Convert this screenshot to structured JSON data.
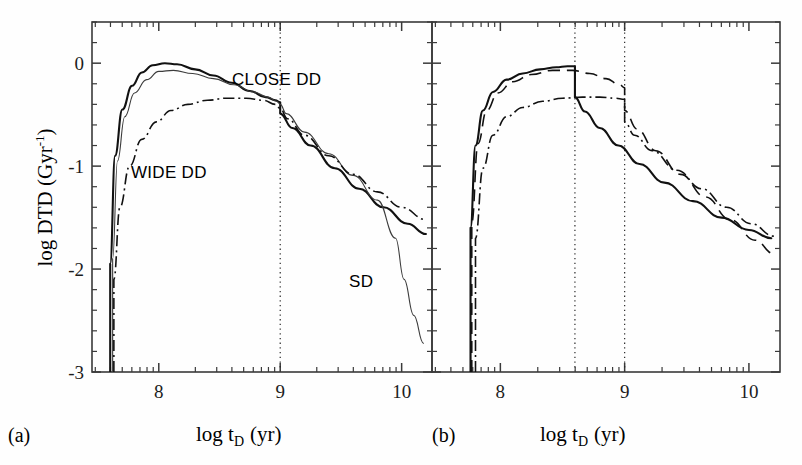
{
  "figure": {
    "panels": [
      {
        "id": "a",
        "tag": "(a)",
        "xlabel_main": "log t",
        "xlabel_sub": "D",
        "xlabel_unit": "(yr)",
        "ylabel_main": "log DTD  (Gyr",
        "ylabel_sup": "-1",
        "ylabel_close": ")",
        "xticks": [
          "8",
          "9",
          "10"
        ],
        "yticks": [
          "0",
          "-1",
          "-2",
          "-3"
        ],
        "annotations": [
          {
            "name": "close-dd-label",
            "text": "CLOSE DD",
            "x": 235,
            "y": 83
          },
          {
            "name": "wide-dd-label",
            "text": "WIDE DD",
            "x": 133,
            "y": 175
          },
          {
            "name": "sd-label",
            "text": "SD",
            "x": 350,
            "y": 284
          }
        ],
        "vlines": [
          9.0
        ]
      },
      {
        "id": "b",
        "tag": "(b)",
        "xlabel_main": "log t",
        "xlabel_sub": "D",
        "xlabel_unit": "(yr)",
        "xticks": [
          "8",
          "9",
          "10"
        ],
        "annotations": [],
        "vlines": [
          8.6,
          9.0
        ]
      }
    ]
  },
  "chart_data": {
    "type": "line",
    "title": "",
    "xlabel": "log t_D (yr)",
    "ylabel": "log DTD (Gyr^-1)",
    "xlim": [
      7.45,
      10.25
    ],
    "ylim": [
      -3.0,
      0.4
    ],
    "grid": false,
    "legend": "inline-annotations",
    "xticks_major": [
      8,
      9,
      10
    ],
    "yticks_major": [
      0,
      -1,
      -2,
      -3
    ],
    "panels": [
      {
        "id": "a",
        "label": "(a)",
        "vertical_dotted_lines": [
          9.0
        ],
        "series": [
          {
            "name": "CLOSE DD",
            "style": "solid-thick",
            "x": [
              7.6,
              7.6,
              7.64,
              7.7,
              7.78,
              7.86,
              7.95,
              8.05,
              8.15,
              8.3,
              8.45,
              8.6,
              8.75,
              8.88,
              8.96,
              9.0,
              9.0,
              9.1,
              9.25,
              9.45,
              9.65,
              9.85,
              10.05,
              10.2
            ],
            "y": [
              -3.0,
              -1.95,
              -0.9,
              -0.45,
              -0.22,
              -0.09,
              -0.02,
              0.0,
              -0.01,
              -0.06,
              -0.12,
              -0.19,
              -0.27,
              -0.33,
              -0.36,
              -0.38,
              -0.49,
              -0.63,
              -0.8,
              -1.02,
              -1.22,
              -1.4,
              -1.56,
              -1.66
            ]
          },
          {
            "name": "SD",
            "style": "solid-thin",
            "x": [
              7.62,
              7.62,
              7.66,
              7.72,
              7.8,
              7.9,
              8.0,
              8.12,
              8.28,
              8.45,
              8.62,
              8.78,
              8.9,
              8.97,
              9.0,
              9.05,
              9.2,
              9.4,
              9.6,
              9.8,
              9.95,
              10.02,
              10.1,
              10.18
            ],
            "y": [
              -3.0,
              -1.9,
              -0.95,
              -0.52,
              -0.29,
              -0.16,
              -0.08,
              -0.07,
              -0.1,
              -0.15,
              -0.21,
              -0.28,
              -0.33,
              -0.37,
              -0.4,
              -0.49,
              -0.67,
              -0.88,
              -1.09,
              -1.33,
              -1.7,
              -2.1,
              -2.45,
              -2.72
            ]
          },
          {
            "name": "WIDE DD",
            "style": "dash-dot",
            "x": [
              7.63,
              7.63,
              7.68,
              7.76,
              7.86,
              7.98,
              8.1,
              8.24,
              8.4,
              8.56,
              8.72,
              8.86,
              8.96,
              9.0,
              9.06,
              9.2,
              9.4,
              9.6,
              9.8,
              10.0,
              10.2
            ],
            "y": [
              -3.0,
              -2.1,
              -1.4,
              -1.0,
              -0.74,
              -0.57,
              -0.46,
              -0.4,
              -0.36,
              -0.34,
              -0.34,
              -0.36,
              -0.4,
              -0.44,
              -0.54,
              -0.7,
              -0.9,
              -1.08,
              -1.25,
              -1.4,
              -1.52
            ]
          }
        ]
      },
      {
        "id": "b",
        "label": "(b)",
        "vertical_dotted_lines": [
          8.6,
          9.0
        ],
        "series": [
          {
            "name": "solid",
            "style": "solid-thick",
            "x": [
              7.76,
              7.76,
              7.8,
              7.86,
              7.94,
              8.05,
              8.18,
              8.32,
              8.45,
              8.54,
              8.6,
              8.6,
              8.68,
              8.8,
              8.95,
              9.12,
              9.32,
              9.55,
              9.78,
              10.0,
              10.18
            ],
            "y": [
              -3.0,
              -1.6,
              -0.8,
              -0.46,
              -0.28,
              -0.16,
              -0.1,
              -0.06,
              -0.04,
              -0.03,
              -0.03,
              -0.33,
              -0.47,
              -0.63,
              -0.8,
              -0.98,
              -1.16,
              -1.34,
              -1.5,
              -1.62,
              -1.7
            ]
          },
          {
            "name": "dashed",
            "style": "dashed",
            "x": [
              7.77,
              7.77,
              7.82,
              7.89,
              7.98,
              8.1,
              8.25,
              8.42,
              8.58,
              8.72,
              8.85,
              8.96,
              9.0,
              9.0,
              9.1,
              9.25,
              9.45,
              9.65,
              9.85,
              10.05,
              10.2
            ],
            "y": [
              -3.0,
              -1.55,
              -0.78,
              -0.46,
              -0.29,
              -0.18,
              -0.11,
              -0.07,
              -0.07,
              -0.1,
              -0.15,
              -0.21,
              -0.24,
              -0.46,
              -0.64,
              -0.85,
              -1.08,
              -1.3,
              -1.52,
              -1.72,
              -1.85
            ]
          },
          {
            "name": "dash-dot",
            "style": "dash-dot",
            "x": [
              7.8,
              7.8,
              7.86,
              7.94,
              8.05,
              8.18,
              8.34,
              8.5,
              8.66,
              8.8,
              8.92,
              9.0,
              9.0,
              9.08,
              9.22,
              9.42,
              9.62,
              9.82,
              10.02,
              10.2
            ],
            "y": [
              -3.0,
              -1.7,
              -1.02,
              -0.7,
              -0.52,
              -0.43,
              -0.37,
              -0.34,
              -0.33,
              -0.33,
              -0.34,
              -0.35,
              -0.57,
              -0.7,
              -0.85,
              -1.04,
              -1.22,
              -1.4,
              -1.56,
              -1.68
            ]
          }
        ]
      }
    ]
  }
}
